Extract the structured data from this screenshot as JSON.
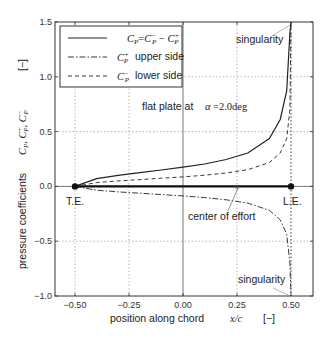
{
  "chart_data": {
    "type": "line",
    "title": "",
    "xlabel": "position along chord",
    "xlabel_var": "x/c",
    "xlabel_unit": "[−]",
    "ylabel": "pressure coefficients",
    "ylabel_vars": "C_P, C_P^+, C_P^-",
    "ylabel_unit": "[−]",
    "xlim": [
      -0.6,
      0.6
    ],
    "ylim": [
      -1.0,
      1.5
    ],
    "x_ticks": [
      "−0.50",
      "−0.25",
      "0.00",
      "0.25",
      "0.50"
    ],
    "x_tick_values": [
      -0.5,
      -0.25,
      0.0,
      0.25,
      0.5
    ],
    "y_ticks": [
      "−1.0",
      "−0.5",
      "0.0",
      "0.5",
      "1.0",
      "1.5"
    ],
    "y_tick_values": [
      -1.0,
      -0.5,
      0.0,
      0.5,
      1.0,
      1.5
    ],
    "grid": true,
    "legend_position": "upper left",
    "series": [
      {
        "name": "C_P = C_P^- − C_P^+",
        "style": "solid",
        "x": [
          -0.5,
          -0.4,
          -0.3,
          -0.2,
          -0.1,
          0.0,
          0.1,
          0.2,
          0.3,
          0.4,
          0.45,
          0.48,
          0.495,
          0.5
        ],
        "y": [
          0.0,
          0.07,
          0.1,
          0.125,
          0.15,
          0.175,
          0.204,
          0.245,
          0.305,
          0.436,
          0.61,
          0.87,
          1.4,
          1.5
        ]
      },
      {
        "name": "C_P^+ upper side",
        "style": "dash-dot",
        "x": [
          -0.5,
          -0.4,
          -0.3,
          -0.2,
          -0.1,
          0.0,
          0.1,
          0.2,
          0.3,
          0.4,
          0.45,
          0.48,
          0.495,
          0.5
        ],
        "y": [
          0.0,
          -0.035,
          -0.05,
          -0.062,
          -0.075,
          -0.087,
          -0.102,
          -0.122,
          -0.152,
          -0.218,
          -0.305,
          -0.435,
          -0.7,
          -1.0
        ]
      },
      {
        "name": "C_P^- lower side",
        "style": "dashed",
        "x": [
          -0.5,
          -0.4,
          -0.3,
          -0.2,
          -0.1,
          0.0,
          0.1,
          0.2,
          0.3,
          0.4,
          0.45,
          0.48,
          0.495,
          0.5
        ],
        "y": [
          0.0,
          0.035,
          0.05,
          0.062,
          0.075,
          0.087,
          0.102,
          0.122,
          0.152,
          0.218,
          0.305,
          0.435,
          0.7,
          1.5
        ]
      }
    ],
    "annotations": [
      {
        "text": "flat plate at",
        "symbol": "α",
        "value": "=2.0deg"
      },
      {
        "text": "singularity",
        "position": "top",
        "x": 0.5,
        "y": 1.5
      },
      {
        "text": "singularity",
        "position": "bottom",
        "x": 0.5,
        "y": -1.0
      },
      {
        "text": "T.E.",
        "x": -0.5,
        "y": 0.0
      },
      {
        "text": "L.E.",
        "x": 0.5,
        "y": 0.0
      },
      {
        "text": "center of effort",
        "x": 0.25,
        "y": 0.0
      }
    ],
    "plate": {
      "x": [
        -0.5,
        0.5
      ],
      "y": 0.0
    }
  },
  "legend": {
    "items": [
      {
        "label_main": "C",
        "label_sub": "P",
        "label_rest": "= C−P − C+P",
        "style": "solid"
      },
      {
        "label_text": "upper side",
        "style": "dash-dot"
      },
      {
        "label_text": "lower side",
        "style": "dashed"
      }
    ]
  },
  "labels": {
    "flat_plate": "flat plate at",
    "alpha": "α",
    "alpha_value": "=2.0deg",
    "singularity_top": "singularity",
    "singularity_bottom": "singularity",
    "te": "T.E.",
    "le": "L.E.",
    "center_of_effort": "center of effort",
    "xlabel": "position along chord",
    "xlabel_var": "x/c",
    "xlabel_unit": "[−]",
    "ylabel": "pressure coefficients",
    "ylabel_unit": "[−]",
    "upper_side": "upper side",
    "lower_side": "lower side"
  }
}
